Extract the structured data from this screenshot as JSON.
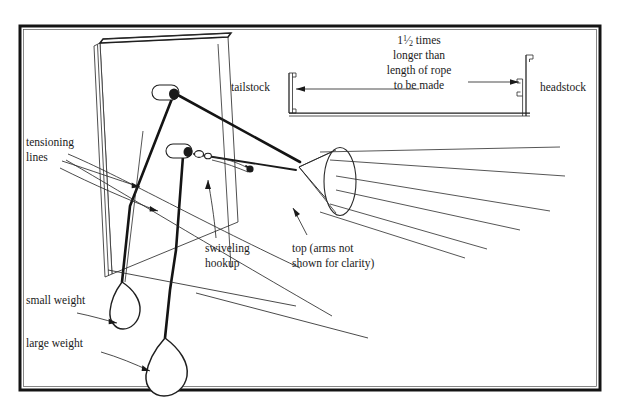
{
  "figure": {
    "title_visible": false,
    "frame": {
      "border_color": "#141414",
      "background": "#ffffff"
    },
    "labels": {
      "tensioning_lines": {
        "line1": "tensioning",
        "line2": "lines"
      },
      "small_weight": "small weight",
      "large_weight": "large weight",
      "swiveling_hookup": {
        "line1": "swiveling",
        "line2": "hookup"
      },
      "top_note": {
        "line1": "top (arms not",
        "line2": "shown for clarity)"
      },
      "tailstock": "tailstock",
      "headstock": "headstock",
      "dimension_note": {
        "line1_prefix": "1",
        "line1_fraction_numerator": "1",
        "line1_fraction_denominator": "2",
        "line1_suffix": " times",
        "line1_full": "1½ times",
        "line2": "longer than",
        "line3": "length of rope",
        "line4": "to be made"
      }
    },
    "components": {
      "board": "tilted board panel",
      "upper_cleat": "upper rounded cleat",
      "lower_cleat": "lower rounded cleat",
      "swivel_links": "small swivel link chain",
      "top_cone": "conical rope-making top",
      "rope_strands": "radiating rope strands",
      "small_weight_shape": "small teardrop weight",
      "large_weight_shape": "large teardrop weight",
      "tailstock_bracket": "U-channel tailstock bracket",
      "headstock_bracket": "U-channel headstock bracket",
      "dimension_arrow": "double-ended dimension arrow"
    },
    "colors": {
      "ink": "#1a1a1a",
      "light_ink": "#2b2b2b",
      "paper": "#ffffff"
    }
  }
}
